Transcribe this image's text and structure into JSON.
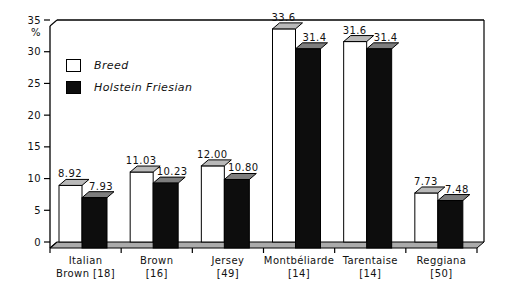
{
  "chart_data": {
    "type": "bar",
    "style": "3d-clustered-column",
    "title": "",
    "xlabel": "",
    "ylabel": "%",
    "ylim": [
      0,
      35
    ],
    "yticks": [
      0,
      5,
      10,
      15,
      20,
      25,
      30,
      35
    ],
    "grid": false,
    "legend_position": "upper-left-inside",
    "categories": [
      "Italian Brown [18]",
      "Brown [16]",
      "Jersey [49]",
      "Montbéliarde [14]",
      "Tarentaise [14]",
      "Reggiana [50]"
    ],
    "category_label_lines": [
      [
        "Italian",
        "Brown [18]"
      ],
      [
        "Brown",
        "[16]"
      ],
      [
        "Jersey",
        "[49]"
      ],
      [
        "Montbéliarde",
        "[14]"
      ],
      [
        "Tarentaise",
        "[14]"
      ],
      [
        "Reggiana",
        "[50]"
      ]
    ],
    "series": [
      {
        "name": "Breed",
        "color": "#ffffff",
        "top_color": "#b9b9b9",
        "values": [
          8.92,
          11.03,
          12.0,
          33.6,
          31.6,
          7.73
        ],
        "value_labels": [
          "8.92",
          "11.03",
          "12.00",
          "33.6",
          "31.6",
          "7.73"
        ]
      },
      {
        "name": "Holstein Friesian",
        "color": "#0d0d0d",
        "top_color": "#7e7e7e",
        "values": [
          7.93,
          10.23,
          10.8,
          31.4,
          31.4,
          7.48
        ],
        "value_labels": [
          "7.93",
          "10.23",
          "10.80",
          "31.4",
          "31.4",
          "7.48"
        ]
      }
    ],
    "floor_color": "#ababab",
    "axis_color": "#000000",
    "plot_background": "#ffffff"
  }
}
